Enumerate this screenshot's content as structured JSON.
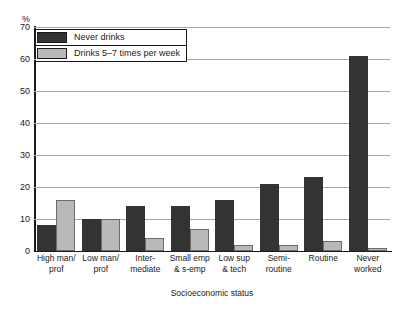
{
  "top_caption": "",
  "axis": {
    "y_unit": "%",
    "y_ticks": [
      0,
      10,
      20,
      30,
      40,
      50,
      60,
      70
    ],
    "x_title": "Socioeconomic status"
  },
  "legend": {
    "items": [
      {
        "label": "Never drinks",
        "color": "#333333",
        "key": "never_drinks"
      },
      {
        "label": "Drinks 5–7 times per week",
        "color": "#b9b9b9",
        "key": "drinks_5_7"
      }
    ]
  },
  "chart_data": {
    "type": "bar",
    "title": "",
    "subtitle": "",
    "xlabel": "Socioeconomic status",
    "ylabel": "%",
    "ylim": [
      0,
      70
    ],
    "ytick_step": 10,
    "grid": true,
    "legend_position": "top-left",
    "categories": [
      "High man/ prof",
      "Low man/ prof",
      "Inter- mediate",
      "Small emp & s-emp",
      "Low sup & tech",
      "Semi- routine",
      "Routine",
      "Never worked"
    ],
    "category_lines": [
      [
        "High man/",
        "prof"
      ],
      [
        "Low man/",
        "prof"
      ],
      [
        "Inter-",
        "mediate"
      ],
      [
        "Small emp",
        "& s-emp"
      ],
      [
        "Low sup",
        "& tech"
      ],
      [
        "Semi-",
        "routine"
      ],
      [
        "Routine",
        ""
      ],
      [
        "Never",
        "worked"
      ]
    ],
    "series": [
      {
        "name": "Never drinks",
        "color": "#333333",
        "values": [
          8,
          10,
          14,
          14,
          16,
          21,
          23,
          61
        ]
      },
      {
        "name": "Drinks 5–7 times per week",
        "color": "#b9b9b9",
        "values": [
          16,
          10,
          4,
          7,
          2,
          2,
          3,
          1
        ]
      }
    ]
  }
}
